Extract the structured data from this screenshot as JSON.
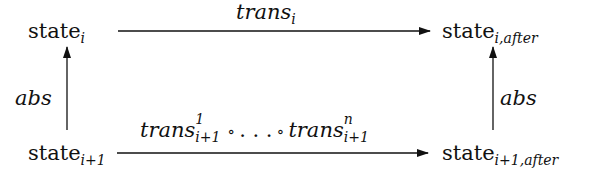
{
  "nodes": {
    "top_left": {
      "base": "state",
      "sub": "i"
    },
    "top_right": {
      "base": "state",
      "sub": "i,after"
    },
    "bottom_left": {
      "base": "state",
      "sub": "i+1"
    },
    "bottom_right": {
      "base": "state",
      "sub": "i+1,after"
    }
  },
  "edges": {
    "top": {
      "label": "trans",
      "sub": "i",
      "from": "top_left",
      "to": "top_right"
    },
    "bottom": {
      "first": {
        "label": "trans",
        "sup": "1",
        "sub": "i+1"
      },
      "compose": "∘",
      "ellipsis": ". . .",
      "last": {
        "label": "trans",
        "sup": "n",
        "sub": "i+1"
      },
      "from": "bottom_left",
      "to": "bottom_right"
    },
    "left": {
      "label": "abs",
      "from": "bottom_left",
      "to": "top_left"
    },
    "right": {
      "label": "abs",
      "from": "bottom_right",
      "to": "top_right"
    }
  }
}
